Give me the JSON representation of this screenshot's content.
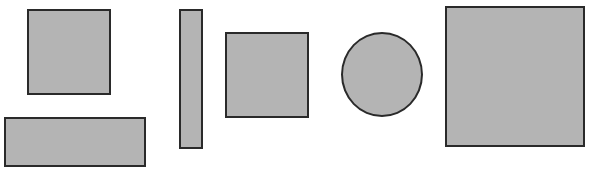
{
  "diagram": {
    "fill_color": "#b4b4b4",
    "stroke_color": "#2a2a2a",
    "background": "#ffffff",
    "shapes": [
      {
        "id": "square-small-left",
        "type": "square",
        "x": 27,
        "y": 9,
        "w": 84,
        "h": 86
      },
      {
        "id": "rect-wide",
        "type": "rectangle",
        "x": 4,
        "y": 117,
        "w": 142,
        "h": 50
      },
      {
        "id": "rect-tall",
        "type": "rectangle",
        "x": 179,
        "y": 9,
        "w": 24,
        "h": 140
      },
      {
        "id": "square-middle",
        "type": "square",
        "x": 225,
        "y": 32,
        "w": 84,
        "h": 86
      },
      {
        "id": "circle",
        "type": "circle",
        "x": 341,
        "y": 32,
        "w": 82,
        "h": 85
      },
      {
        "id": "square-large",
        "type": "square",
        "x": 445,
        "y": 6,
        "w": 140,
        "h": 141
      }
    ]
  }
}
